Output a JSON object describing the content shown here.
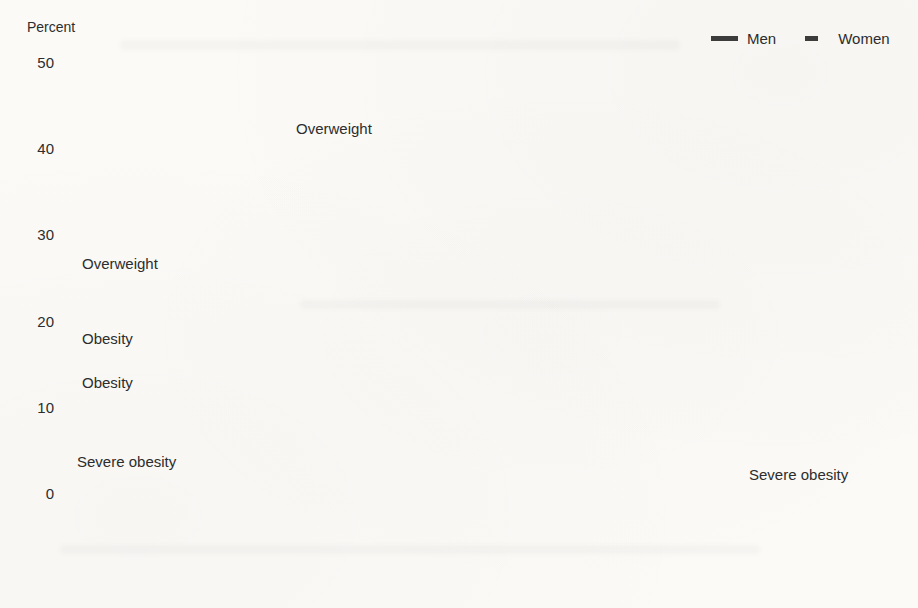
{
  "figure": {
    "axis_unit_label": "Percent",
    "y_tick_labels": [
      "50",
      "40",
      "30",
      "20",
      "10",
      "0"
    ],
    "legend": {
      "men_label": "Men",
      "women_label": "Women"
    },
    "annotations": {
      "overweight_men": "Overweight",
      "overweight_women": "Overweight",
      "obesity_women": "Obesity",
      "obesity_men": "Obesity",
      "severe_obesity_women": "Severe obesity",
      "severe_obesity_men": "Severe obesity"
    },
    "colors": {
      "dark_line": "#3d3d3d",
      "obesity_men_line": "#bdbdbd",
      "obesity_women_line": "#aeaeae",
      "severe_men_line": "#b3b3b3",
      "severe_women_line": "#9c9c9c",
      "axis": "#3a3a3a",
      "text": "#2d2d2d"
    }
  },
  "chart_data": {
    "type": "line",
    "title": "",
    "xlabel": "",
    "ylabel": "Percent",
    "ylim": [
      0,
      50
    ],
    "y_ticks": [
      0,
      10,
      20,
      30,
      40,
      50
    ],
    "grid": false,
    "legend_position": "top-right",
    "legend_entries": [
      "Men",
      "Women"
    ],
    "categories": [
      "1960–1962",
      "1971–1974",
      "1976–1980",
      "1988–1994",
      "1999–2000",
      "2001–2002",
      "2003–2004",
      "2005–2006",
      "2007–2008",
      "2009–2010",
      "2011–2012",
      "2013–2014",
      "2015–2016",
      "2017–2016"
    ],
    "series": [
      {
        "id": "overweight-men",
        "name": "Overweight, men",
        "sex": "Men",
        "measure": "Overweight",
        "line": "solid-dark",
        "values": [
          38.6,
          41.6,
          40.1,
          40.0,
          39.6,
          41.7,
          39.0,
          39.3,
          39.5,
          38.6,
          37.6,
          38.6,
          36.0,
          33.5
        ]
      },
      {
        "id": "overweight-women",
        "name": "Overweight, women",
        "sex": "Women",
        "measure": "Overweight",
        "line": "dashed-dark",
        "values": [
          24.7,
          24.3,
          24.6,
          25.7,
          28.1,
          27.5,
          26.9,
          24.7,
          27.6,
          28.2,
          29.3,
          26.1,
          26.3,
          26.5
        ]
      },
      {
        "id": "obesity-men",
        "name": "Obesity, men",
        "sex": "Men",
        "measure": "Obesity",
        "line": "solid-gray",
        "values": [
          10.7,
          12.1,
          12.8,
          20.0,
          28.0,
          28.8,
          31.1,
          34.0,
          32.6,
          36.3,
          34.3,
          36.0,
          39.0,
          43.0
        ]
      },
      {
        "id": "obesity-women",
        "name": "Obesity, women",
        "sex": "Women",
        "measure": "Obesity",
        "line": "dashed-gray",
        "values": [
          15.8,
          16.6,
          17.0,
          26.0,
          34.0,
          33.5,
          35.0,
          36.4,
          36.4,
          36.6,
          36.4,
          41.3,
          41.6,
          42.0
        ]
      },
      {
        "id": "severe-obesity-men",
        "name": "Severe obesity, men",
        "sex": "Men",
        "measure": "Severe obesity",
        "line": "solid-lightgray",
        "values": [
          0.3,
          0.5,
          0.6,
          1.7,
          3.3,
          3.5,
          2.5,
          4.1,
          4.1,
          4.2,
          4.4,
          5.4,
          5.3,
          6.9
        ]
      },
      {
        "id": "severe-obesity-women",
        "name": "Severe obesity, women",
        "sex": "Women",
        "measure": "Severe obesity",
        "line": "dashed-medgray",
        "values": [
          1.4,
          1.7,
          2.0,
          4.0,
          6.2,
          6.6,
          7.0,
          7.5,
          7.3,
          7.8,
          8.9,
          10.4,
          10.0,
          11.5
        ]
      }
    ]
  }
}
